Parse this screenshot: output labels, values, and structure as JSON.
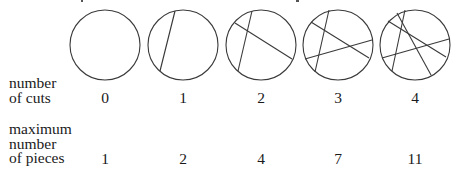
{
  "diagram": {
    "stroke_color": "#3a3a3a",
    "circle_radius": 35,
    "circle_center_y": 45,
    "circles": [
      {
        "cx": 105,
        "cuts": []
      },
      {
        "cx": 183,
        "cuts": [
          [
            175,
            11,
            160,
            71
          ]
        ]
      },
      {
        "cx": 261,
        "cuts": [
          [
            252,
            11,
            238,
            71
          ],
          [
            235,
            23,
            292,
            59
          ]
        ]
      },
      {
        "cx": 338,
        "cuts": [
          [
            329,
            10,
            315,
            72
          ],
          [
            311,
            22,
            369,
            58
          ],
          [
            305,
            59,
            372,
            40
          ]
        ]
      },
      {
        "cx": 415,
        "cuts": [
          [
            405,
            10,
            392,
            71
          ],
          [
            388,
            21,
            446,
            57
          ],
          [
            382,
            58,
            449,
            39
          ],
          [
            397,
            13,
            431,
            75
          ]
        ]
      }
    ]
  },
  "rows": {
    "cuts_label": [
      "number",
      "of cuts"
    ],
    "pieces_label": [
      "maximum",
      "number",
      "of pieces"
    ],
    "cuts_values": [
      "0",
      "1",
      "2",
      "3",
      "4"
    ],
    "pieces_values": [
      "1",
      "2",
      "4",
      "7",
      "11"
    ]
  }
}
